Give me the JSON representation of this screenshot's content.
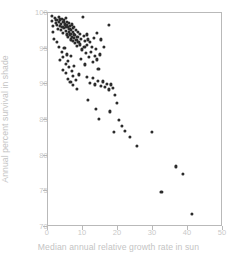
{
  "chart_data": {
    "type": "scatter",
    "title": "",
    "xlabel": "Median annual relative growth rate in sun",
    "ylabel": "Annual percent survival in shade",
    "xlim": [
      0,
      50
    ],
    "ylim": [
      70,
      100
    ],
    "xticks": [
      0,
      10,
      20,
      30,
      40,
      50
    ],
    "yticks": [
      70,
      75,
      80,
      85,
      90,
      95,
      100
    ],
    "grid": false,
    "legend": null,
    "marker_color": "#2b2b2b",
    "frame_color": "#b9b9b9",
    "label_color": "#c4c4c4",
    "background": "#ffffff",
    "n_points": 130,
    "points": [
      [
        1.0,
        99.6
      ],
      [
        1.2,
        98.9
      ],
      [
        1.4,
        98.2
      ],
      [
        1.5,
        97.4
      ],
      [
        1.6,
        96.4
      ],
      [
        2.0,
        99.3
      ],
      [
        2.2,
        98.6
      ],
      [
        2.4,
        99.0
      ],
      [
        2.6,
        98.3
      ],
      [
        2.8,
        97.8
      ],
      [
        3.0,
        99.4
      ],
      [
        3.1,
        98.8
      ],
      [
        3.3,
        98.2
      ],
      [
        3.5,
        99.1
      ],
      [
        3.6,
        97.6
      ],
      [
        3.8,
        98.5
      ],
      [
        4.0,
        99.2
      ],
      [
        4.1,
        98.0
      ],
      [
        4.2,
        97.2
      ],
      [
        4.4,
        98.7
      ],
      [
        4.5,
        99.0
      ],
      [
        4.6,
        97.9
      ],
      [
        4.8,
        98.4
      ],
      [
        5.0,
        99.3
      ],
      [
        5.1,
        98.1
      ],
      [
        5.2,
        97.5
      ],
      [
        5.3,
        98.8
      ],
      [
        5.4,
        97.0
      ],
      [
        5.5,
        98.3
      ],
      [
        5.6,
        96.6
      ],
      [
        5.8,
        98.0
      ],
      [
        5.9,
        97.3
      ],
      [
        6.0,
        98.6
      ],
      [
        6.1,
        97.8
      ],
      [
        6.2,
        96.9
      ],
      [
        6.3,
        98.2
      ],
      [
        6.4,
        97.1
      ],
      [
        6.5,
        96.3
      ],
      [
        6.6,
        97.6
      ],
      [
        6.8,
        98.4
      ],
      [
        6.9,
        96.7
      ],
      [
        7.0,
        97.9
      ],
      [
        7.1,
        96.1
      ],
      [
        7.2,
        97.4
      ],
      [
        7.3,
        98.1
      ],
      [
        7.4,
        96.5
      ],
      [
        7.5,
        97.0
      ],
      [
        7.6,
        95.8
      ],
      [
        7.8,
        96.9
      ],
      [
        8.0,
        97.6
      ],
      [
        8.1,
        96.2
      ],
      [
        8.2,
        95.4
      ],
      [
        8.4,
        96.6
      ],
      [
        8.5,
        97.3
      ],
      [
        8.6,
        95.9
      ],
      [
        8.8,
        96.0
      ],
      [
        9.0,
        97.1
      ],
      [
        9.2,
        95.6
      ],
      [
        9.4,
        96.4
      ],
      [
        9.6,
        94.9
      ],
      [
        10.0,
        99.5
      ],
      [
        10.2,
        96.8
      ],
      [
        10.4,
        95.2
      ],
      [
        10.6,
        96.1
      ],
      [
        10.8,
        94.4
      ],
      [
        11.0,
        97.0
      ],
      [
        11.2,
        95.5
      ],
      [
        11.5,
        96.3
      ],
      [
        11.8,
        93.8
      ],
      [
        12.0,
        96.0
      ],
      [
        12.3,
        94.6
      ],
      [
        12.6,
        95.3
      ],
      [
        12.9,
        93.2
      ],
      [
        13.0,
        96.5
      ],
      [
        13.4,
        94.0
      ],
      [
        13.8,
        95.0
      ],
      [
        14.0,
        93.5
      ],
      [
        14.4,
        92.2
      ],
      [
        14.8,
        94.2
      ],
      [
        2.5,
        96.0
      ],
      [
        3.2,
        95.3
      ],
      [
        4.0,
        94.6
      ],
      [
        4.7,
        95.1
      ],
      [
        5.5,
        94.2
      ],
      [
        3.5,
        93.4
      ],
      [
        4.3,
        93.8
      ],
      [
        5.0,
        92.9
      ],
      [
        5.8,
        93.3
      ],
      [
        6.5,
        94.0
      ],
      [
        4.2,
        92.0
      ],
      [
        5.2,
        91.6
      ],
      [
        6.0,
        92.4
      ],
      [
        6.8,
        91.9
      ],
      [
        7.5,
        92.6
      ],
      [
        5.6,
        90.8
      ],
      [
        6.4,
        90.3
      ],
      [
        7.2,
        91.2
      ],
      [
        8.0,
        90.6
      ],
      [
        8.8,
        91.4
      ],
      [
        9.5,
        93.6
      ],
      [
        10.5,
        92.8
      ],
      [
        11.2,
        91.0
      ],
      [
        12.0,
        90.2
      ],
      [
        12.8,
        90.9
      ],
      [
        7.0,
        89.9
      ],
      [
        8.2,
        89.4
      ],
      [
        13.5,
        90.0
      ],
      [
        14.2,
        90.5
      ],
      [
        15.0,
        89.8
      ],
      [
        15.6,
        90.4
      ],
      [
        16.2,
        89.6
      ],
      [
        16.8,
        90.1
      ],
      [
        17.4,
        89.3
      ],
      [
        18.0,
        90.0
      ],
      [
        18.6,
        89.5
      ],
      [
        11.5,
        87.8
      ],
      [
        13.8,
        86.5
      ],
      [
        14.6,
        85.2
      ],
      [
        17.5,
        98.3
      ],
      [
        16.0,
        95.2
      ],
      [
        15.2,
        96.3
      ],
      [
        14.0,
        97.2
      ],
      [
        19.0,
        88.5
      ],
      [
        19.6,
        87.4
      ],
      [
        17.8,
        86.2
      ],
      [
        20.2,
        85.0
      ],
      [
        21.0,
        84.2
      ],
      [
        18.8,
        83.3
      ],
      [
        22.0,
        83.5
      ],
      [
        23.5,
        82.6
      ],
      [
        25.5,
        81.4
      ],
      [
        29.6,
        83.3
      ],
      [
        36.5,
        78.5
      ],
      [
        38.6,
        77.4
      ],
      [
        32.4,
        74.9
      ],
      [
        41.2,
        71.8
      ]
    ]
  }
}
